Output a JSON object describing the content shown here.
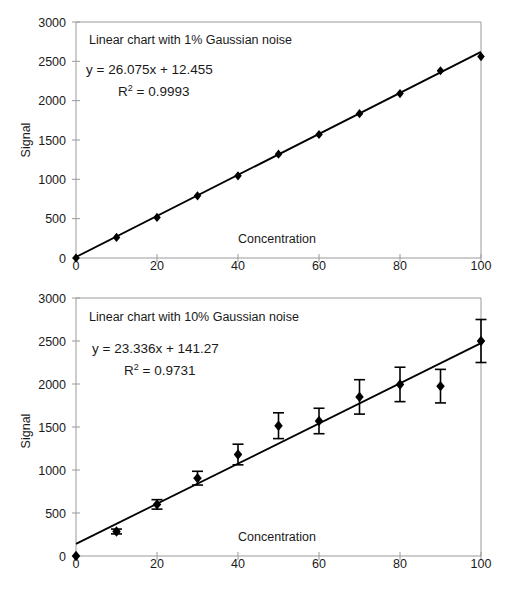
{
  "figure": {
    "background_color": "#ffffff",
    "ink_color": "#1a1a1a",
    "axis_color": "#9a9a9a",
    "series_color": "#000000"
  },
  "chart_data": [
    {
      "id": "top",
      "type": "scatter",
      "title": "Linear chart with 1% Gaussian noise",
      "annotations": [
        {
          "id": "equation",
          "text": "y  =  26.075x  +  12.455"
        },
        {
          "id": "r-squared",
          "prefix": "R",
          "superscript": "2",
          "suffix": "  =  0.9993"
        }
      ],
      "xlabel": "Concentration",
      "ylabel": "Signal",
      "xlim": [
        0,
        100
      ],
      "ylim": [
        0,
        3000
      ],
      "xticks": [
        0,
        20,
        40,
        60,
        80,
        100
      ],
      "yticks": [
        0,
        500,
        1000,
        1500,
        2000,
        2500,
        3000
      ],
      "xtick_labels": [
        "0",
        "20",
        "40",
        "60",
        "80",
        "100"
      ],
      "ytick_labels": [
        "0",
        "500",
        "1000",
        "1500",
        "2000",
        "2500",
        "3000"
      ],
      "grid": false,
      "legend": "none",
      "marker": "diamond",
      "has_trendline": true,
      "has_error_bars": false,
      "trendline": {
        "slope": 26.075,
        "intercept": 12.455,
        "r_squared": 0.9993
      },
      "x": [
        0,
        10,
        20,
        30,
        40,
        50,
        60,
        70,
        80,
        90,
        100
      ],
      "values": [
        0,
        262,
        516,
        790,
        1045,
        1320,
        1570,
        1835,
        2090,
        2380,
        2560
      ]
    },
    {
      "id": "bottom",
      "type": "scatter",
      "title": "Linear chart with 10% Gaussian noise",
      "annotations": [
        {
          "id": "equation",
          "text": "y  =  23.336x  +  141.27"
        },
        {
          "id": "r-squared",
          "prefix": "R",
          "superscript": "2",
          "suffix": "  =  0.9731"
        }
      ],
      "xlabel": "Concentration",
      "ylabel": "Signal",
      "xlim": [
        0,
        100
      ],
      "ylim": [
        0,
        3000
      ],
      "xticks": [
        0,
        20,
        40,
        60,
        80,
        100
      ],
      "yticks": [
        0,
        500,
        1000,
        1500,
        2000,
        2500,
        3000
      ],
      "xtick_labels": [
        "0",
        "20",
        "40",
        "60",
        "80",
        "100"
      ],
      "ytick_labels": [
        "0",
        "500",
        "1000",
        "1500",
        "2000",
        "2500",
        "3000"
      ],
      "grid": false,
      "legend": "none",
      "marker": "diamond",
      "has_trendline": true,
      "has_error_bars": true,
      "trendline": {
        "slope": 23.336,
        "intercept": 141.27,
        "r_squared": 0.9731
      },
      "x": [
        0,
        10,
        20,
        30,
        40,
        50,
        60,
        70,
        80,
        90,
        100
      ],
      "values": [
        0,
        285,
        600,
        905,
        1180,
        1515,
        1570,
        1850,
        1995,
        1975,
        2500
      ],
      "errors": [
        0,
        28,
        55,
        80,
        120,
        150,
        148,
        200,
        200,
        195,
        250
      ]
    }
  ]
}
